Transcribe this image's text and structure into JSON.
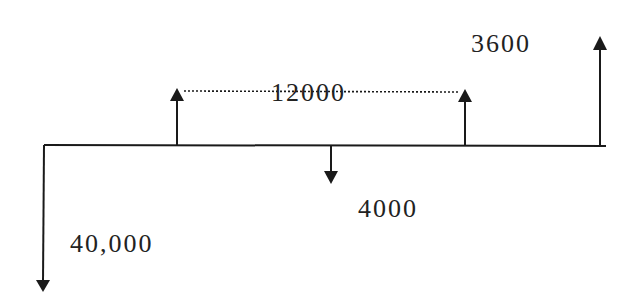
{
  "diagram": {
    "type": "cash-flow-diagram",
    "line_color": "#1a1a1a",
    "text_color": "#222222",
    "baseline": {
      "x_start": 44,
      "x_end": 606,
      "y": 145
    },
    "flows": [
      {
        "id": "initial",
        "direction": "down",
        "x": 43,
        "tip_y": 291,
        "label": "40,000",
        "label_x": 70,
        "label_y": 230
      },
      {
        "id": "inflow-1",
        "direction": "up",
        "x": 177,
        "tip_y": 89,
        "label": "12000"
      },
      {
        "id": "outflow",
        "direction": "down",
        "x": 331,
        "tip_y": 183,
        "label": "4000",
        "label_x": 358,
        "label_y": 196
      },
      {
        "id": "inflow-2",
        "direction": "up",
        "x": 465,
        "tip_y": 90,
        "label": "12000"
      },
      {
        "id": "final",
        "direction": "up",
        "x": 600,
        "tip_y": 37,
        "label": "3600",
        "label_x": 472,
        "label_y": 32
      }
    ],
    "uniform_series": {
      "label": "12000",
      "dotted_line": {
        "x1": 184,
        "x2": 458,
        "y": 91
      },
      "label_x": 272,
      "label_y": 80
    }
  },
  "labels": {
    "initial": "40,000",
    "series": "12000",
    "outflow": "4000",
    "final": "3600"
  }
}
